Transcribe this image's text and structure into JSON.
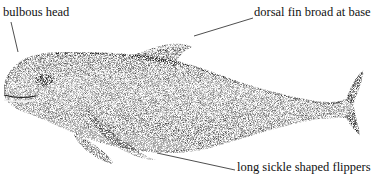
{
  "figure": {
    "labels": {
      "head": "bulbous head",
      "dorsal": "dorsal fin broad at base",
      "flipper": "long sickle shaped flippers"
    }
  },
  "colors": {
    "ink": "#111111",
    "background": "#ffffff"
  }
}
